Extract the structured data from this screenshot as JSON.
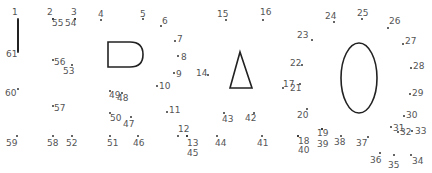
{
  "puzzle": {
    "type": "connect-the-dots",
    "stroke_color": "#222222",
    "label_color": "#555555",
    "points": [
      {
        "n": "1",
        "lx": 12,
        "ly": 8,
        "dx": 18,
        "dy": 19
      },
      {
        "n": "2",
        "lx": 47,
        "ly": 8,
        "dx": 53,
        "dy": 19
      },
      {
        "n": "3",
        "lx": 71,
        "ly": 8,
        "dx": 75,
        "dy": 19
      },
      {
        "n": "4",
        "lx": 98,
        "ly": 10,
        "dx": 101,
        "dy": 20
      },
      {
        "n": "5",
        "lx": 140,
        "ly": 10,
        "dx": 143,
        "dy": 19
      },
      {
        "n": "6",
        "lx": 162,
        "ly": 17,
        "dx": 161,
        "dy": 26
      },
      {
        "n": "7",
        "lx": 177,
        "ly": 35,
        "dx": 175,
        "dy": 41
      },
      {
        "n": "8",
        "lx": 181,
        "ly": 53,
        "dx": 178,
        "dy": 56
      },
      {
        "n": "9",
        "lx": 176,
        "ly": 70,
        "dx": 174,
        "dy": 73
      },
      {
        "n": "10",
        "lx": 159,
        "ly": 82,
        "dx": 157,
        "dy": 86
      },
      {
        "n": "11",
        "lx": 169,
        "ly": 106,
        "dx": 167,
        "dy": 112
      },
      {
        "n": "12",
        "lx": 178,
        "ly": 125,
        "dx": 178,
        "dy": 136
      },
      {
        "n": "13",
        "lx": 187,
        "ly": 139,
        "dx": 187,
        "dy": 136
      },
      {
        "n": "14",
        "lx": 196,
        "ly": 69,
        "dx": 208,
        "dy": 75
      },
      {
        "n": "15",
        "lx": 217,
        "ly": 10,
        "dx": 226,
        "dy": 20
      },
      {
        "n": "16",
        "lx": 260,
        "ly": 8,
        "dx": 263,
        "dy": 20
      },
      {
        "n": "17",
        "lx": 283,
        "ly": 80,
        "dx": 283,
        "dy": 88
      },
      {
        "n": "18",
        "lx": 298,
        "ly": 137,
        "dx": 298,
        "dy": 136
      },
      {
        "n": "19",
        "lx": 317,
        "ly": 129,
        "dx": 322,
        "dy": 129
      },
      {
        "n": "20",
        "lx": 297,
        "ly": 111,
        "dx": 307,
        "dy": 109
      },
      {
        "n": "21",
        "lx": 290,
        "ly": 84,
        "dx": 300,
        "dy": 84
      },
      {
        "n": "22",
        "lx": 290,
        "ly": 59,
        "dx": 302,
        "dy": 65
      },
      {
        "n": "23",
        "lx": 297,
        "ly": 31,
        "dx": 312,
        "dy": 40
      },
      {
        "n": "24",
        "lx": 325,
        "ly": 12,
        "dx": 334,
        "dy": 22
      },
      {
        "n": "25",
        "lx": 357,
        "ly": 9,
        "dx": 362,
        "dy": 19
      },
      {
        "n": "26",
        "lx": 389,
        "ly": 17,
        "dx": 388,
        "dy": 28
      },
      {
        "n": "27",
        "lx": 405,
        "ly": 37,
        "dx": 403,
        "dy": 44
      },
      {
        "n": "28",
        "lx": 413,
        "ly": 62,
        "dx": 411,
        "dy": 68
      },
      {
        "n": "29",
        "lx": 412,
        "ly": 89,
        "dx": 410,
        "dy": 94
      },
      {
        "n": "30",
        "lx": 406,
        "ly": 111,
        "dx": 404,
        "dy": 116
      },
      {
        "n": "31",
        "lx": 393,
        "ly": 124,
        "dx": 391,
        "dy": 127
      },
      {
        "n": "32",
        "lx": 400,
        "ly": 128,
        "dx": 398,
        "dy": 132
      },
      {
        "n": "33",
        "lx": 415,
        "ly": 127,
        "dx": 412,
        "dy": 131
      },
      {
        "n": "34",
        "lx": 412,
        "ly": 157,
        "dx": 411,
        "dy": 155
      },
      {
        "n": "35",
        "lx": 388,
        "ly": 161,
        "dx": 394,
        "dy": 155
      },
      {
        "n": "36",
        "lx": 370,
        "ly": 156,
        "dx": 380,
        "dy": 153
      },
      {
        "n": "37",
        "lx": 356,
        "ly": 139,
        "dx": 368,
        "dy": 137
      },
      {
        "n": "38",
        "lx": 334,
        "ly": 138,
        "dx": 341,
        "dy": 136
      },
      {
        "n": "39",
        "lx": 317,
        "ly": 140,
        "dx": 322,
        "dy": 129
      },
      {
        "n": "40",
        "lx": 298,
        "ly": 146,
        "dx": 298,
        "dy": 136
      },
      {
        "n": "41",
        "lx": 257,
        "ly": 139,
        "dx": 262,
        "dy": 136
      },
      {
        "n": "42",
        "lx": 245,
        "ly": 114,
        "dx": 254,
        "dy": 113
      },
      {
        "n": "43",
        "lx": 222,
        "ly": 115,
        "dx": 224,
        "dy": 113
      },
      {
        "n": "44",
        "lx": 215,
        "ly": 139,
        "dx": 217,
        "dy": 136
      },
      {
        "n": "45",
        "lx": 187,
        "ly": 149,
        "dx": 187,
        "dy": 136
      },
      {
        "n": "46",
        "lx": 133,
        "ly": 139,
        "dx": 138,
        "dy": 136
      },
      {
        "n": "47",
        "lx": 123,
        "ly": 120,
        "dx": 131,
        "dy": 117
      },
      {
        "n": "48",
        "lx": 117,
        "ly": 94,
        "dx": 122,
        "dy": 93
      },
      {
        "n": "49",
        "lx": 109,
        "ly": 91,
        "dx": 110,
        "dy": 91
      },
      {
        "n": "50",
        "lx": 110,
        "ly": 114,
        "dx": 110,
        "dy": 113
      },
      {
        "n": "51",
        "lx": 107,
        "ly": 139,
        "dx": 110,
        "dy": 136
      },
      {
        "n": "52",
        "lx": 66,
        "ly": 139,
        "dx": 72,
        "dy": 136
      },
      {
        "n": "53",
        "lx": 63,
        "ly": 67,
        "dx": 72,
        "dy": 65
      },
      {
        "n": "54",
        "lx": 65,
        "ly": 19,
        "dx": 75,
        "dy": 19
      },
      {
        "n": "55",
        "lx": 52,
        "ly": 19,
        "dx": 53,
        "dy": 19
      },
      {
        "n": "56",
        "lx": 54,
        "ly": 58,
        "dx": 53,
        "dy": 60
      },
      {
        "n": "57",
        "lx": 54,
        "ly": 104,
        "dx": 53,
        "dy": 106
      },
      {
        "n": "58",
        "lx": 47,
        "ly": 139,
        "dx": 53,
        "dy": 136
      },
      {
        "n": "59",
        "lx": 6,
        "ly": 139,
        "dx": 17,
        "dy": 136
      },
      {
        "n": "60",
        "lx": 5,
        "ly": 89,
        "dx": 18,
        "dy": 89
      },
      {
        "n": "61",
        "lx": 6,
        "ly": 50,
        "dx": 18,
        "dy": 52
      }
    ],
    "shapes": {
      "vertical_line": {
        "x1": 18,
        "y1": 19,
        "x2": 18,
        "y2": 52
      },
      "d_shape": {
        "path": "M108 42 L130 42 Q143 42 143 54.5 Q143 67 130 67 L108 67 Z"
      },
      "triangle": {
        "points": "240,52 230,88 252,88"
      },
      "oval": {
        "cx": 359,
        "cy": 78,
        "rx": 18,
        "ry": 35
      }
    }
  }
}
